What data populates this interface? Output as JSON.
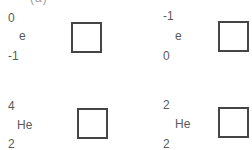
{
  "header_fragment": "(a)",
  "items": [
    {
      "upper": "0",
      "symbol": "e",
      "lower": "-1",
      "answer": ""
    },
    {
      "upper": "-1",
      "symbol": "e",
      "lower": "0",
      "answer": ""
    },
    {
      "upper": "4",
      "symbol": "He",
      "lower": "2",
      "answer": ""
    },
    {
      "upper": "2",
      "symbol": "He",
      "lower": "2",
      "answer": ""
    }
  ],
  "colors": {
    "text": "#5a5a5a",
    "box_border": "#454545",
    "background": "#ffffff"
  }
}
